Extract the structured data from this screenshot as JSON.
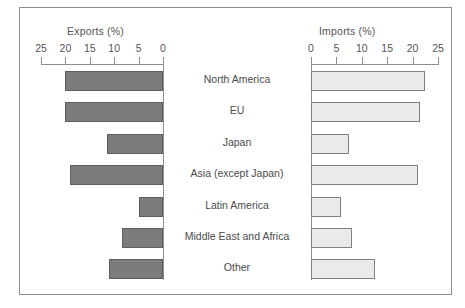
{
  "chart_data": {
    "type": "bar",
    "title": "",
    "orientation": "horizontal",
    "layout": "bidirectional-population-pyramid",
    "grid": false,
    "legend": null,
    "categories": [
      "North America",
      "EU",
      "Japan",
      "Asia (except Japan)",
      "Latin America",
      "Middle East and Africa",
      "Other"
    ],
    "series": [
      {
        "name": "Exports (%)",
        "side": "left",
        "color": "#7c7c7c",
        "values": [
          20,
          20,
          11.5,
          19,
          5,
          8.5,
          11
        ]
      },
      {
        "name": "Imports (%)",
        "side": "right",
        "color": "#eaeaea",
        "values": [
          22.5,
          21.5,
          7.5,
          21,
          6,
          8,
          12.5
        ]
      }
    ],
    "left_axis": {
      "label": "Exports (%)",
      "ticks": [
        25,
        20,
        15,
        10,
        5,
        0
      ],
      "tick_labels": [
        "25",
        "20",
        "15",
        "10",
        "5",
        "0"
      ],
      "range": [
        25,
        0
      ],
      "direction": "right-to-left"
    },
    "right_axis": {
      "label": "Imports (%)",
      "ticks": [
        0,
        5,
        10,
        15,
        20,
        25
      ],
      "tick_labels": [
        "0",
        "5",
        "10",
        "15",
        "20",
        "25"
      ],
      "range": [
        0,
        25
      ],
      "direction": "left-to-right"
    },
    "xlabel": "",
    "ylabel": ""
  }
}
